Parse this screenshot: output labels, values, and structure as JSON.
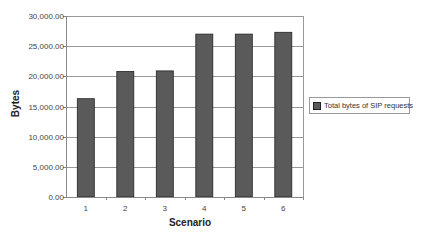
{
  "chart_data": {
    "type": "bar",
    "title": "",
    "xlabel": "Scenario",
    "ylabel": "Bytes",
    "categories": [
      "1",
      "2",
      "3",
      "4",
      "5",
      "6"
    ],
    "series": [
      {
        "name": "Total bytes of SIP requests",
        "values": [
          16300,
          20800,
          20900,
          27000,
          27000,
          27300
        ]
      }
    ],
    "ylim": [
      0,
      30000
    ],
    "yticks": [
      0,
      5000,
      10000,
      15000,
      20000,
      25000,
      30000
    ],
    "ytick_labels": [
      "0.00",
      "5,000.00",
      "10,000.00",
      "15,000.00",
      "20,000.00",
      "25,000.00",
      "30,000.00"
    ],
    "grid": true,
    "legend_position": "right",
    "colors": {
      "bar": "#5a5a5a",
      "bar_border": "#222222",
      "grid": "#999999",
      "axis": "#888888"
    }
  }
}
